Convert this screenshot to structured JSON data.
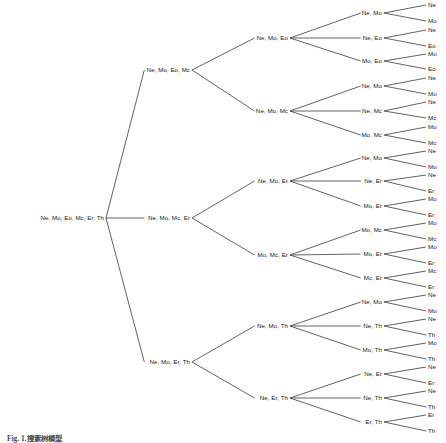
{
  "figure": {
    "type": "hierarchical-tree-diagram",
    "caption": "Fig. 1.搜索树模型",
    "orientation": "left-to-right",
    "levels": 5,
    "line_color": "#3a3a3a",
    "text_color": "#1a1a1a",
    "background": "#ffffff"
  },
  "tree": {
    "root": {
      "label": "Ne, Mo, Eo, Mc, Er, Th",
      "x": 104,
      "y": 218
    },
    "level2": [
      {
        "label": "Ne, Mo, Eo, Mc",
        "x": 190,
        "y": 70
      },
      {
        "label": "Ne, Mo, Mc, Er",
        "x": 190,
        "y": 218
      },
      {
        "label": "Ne, Mo, Er, Th",
        "x": 190,
        "y": 362
      }
    ],
    "level3": [
      {
        "label": "Ne, Mo, Eo",
        "x": 288,
        "y": 38
      },
      {
        "label": "Ne, Mo, Mc",
        "x": 288,
        "y": 111
      },
      {
        "label": "Ne, Mo, Er",
        "x": 288,
        "y": 181
      },
      {
        "label": "Mo, Mc, Er",
        "x": 288,
        "y": 255
      },
      {
        "label": "Ne, Mo, Th",
        "x": 288,
        "y": 326
      },
      {
        "label": "Ne, Er, Th",
        "x": 288,
        "y": 398
      }
    ],
    "level4": [
      {
        "label": "Ne, Mo",
        "x": 382,
        "y": 13
      },
      {
        "label": "Ne, Eo",
        "x": 382,
        "y": 38
      },
      {
        "label": "Mo, Eo",
        "x": 382,
        "y": 61
      },
      {
        "label": "Ne, Mo",
        "x": 382,
        "y": 86
      },
      {
        "label": "Ne, Mc",
        "x": 382,
        "y": 111
      },
      {
        "label": "Mo, Mc",
        "x": 382,
        "y": 135
      },
      {
        "label": "Ne, Mo",
        "x": 382,
        "y": 158
      },
      {
        "label": "Ne, Er",
        "x": 382,
        "y": 181
      },
      {
        "label": "Mo, Er",
        "x": 382,
        "y": 206
      },
      {
        "label": "Mo, Mc",
        "x": 382,
        "y": 230
      },
      {
        "label": "Mo, Er",
        "x": 382,
        "y": 254
      },
      {
        "label": "Mc, Er",
        "x": 382,
        "y": 278
      },
      {
        "label": "Ne, Mo",
        "x": 382,
        "y": 302
      },
      {
        "label": "Ne, Th",
        "x": 382,
        "y": 326
      },
      {
        "label": "Mo, Th",
        "x": 382,
        "y": 350
      },
      {
        "label": "Ne, Er",
        "x": 382,
        "y": 374
      },
      {
        "label": "Ne, Th",
        "x": 382,
        "y": 398
      },
      {
        "label": "Er, Th",
        "x": 382,
        "y": 422
      }
    ],
    "leaves": [
      {
        "label": "Ne",
        "x": 428,
        "y": 5
      },
      {
        "label": "Mo",
        "x": 428,
        "y": 21
      },
      {
        "label": "Ne",
        "x": 428,
        "y": 30
      },
      {
        "label": "Eo",
        "x": 428,
        "y": 46
      },
      {
        "label": "Mo",
        "x": 428,
        "y": 54
      },
      {
        "label": "Eo",
        "x": 428,
        "y": 69
      },
      {
        "label": "Ne",
        "x": 428,
        "y": 78
      },
      {
        "label": "Mo",
        "x": 428,
        "y": 94
      },
      {
        "label": "Ne",
        "x": 428,
        "y": 102
      },
      {
        "label": "Mc",
        "x": 428,
        "y": 118
      },
      {
        "label": "Mo",
        "x": 428,
        "y": 127
      },
      {
        "label": "Mc",
        "x": 428,
        "y": 143
      },
      {
        "label": "Ne",
        "x": 428,
        "y": 151
      },
      {
        "label": "Mo",
        "x": 428,
        "y": 167
      },
      {
        "label": "Ne",
        "x": 428,
        "y": 175
      },
      {
        "label": "Er",
        "x": 428,
        "y": 191
      },
      {
        "label": "Mo",
        "x": 428,
        "y": 199
      },
      {
        "label": "Er",
        "x": 428,
        "y": 215
      },
      {
        "label": "Mo",
        "x": 428,
        "y": 223
      },
      {
        "label": "Mc",
        "x": 428,
        "y": 239
      },
      {
        "label": "Mo",
        "x": 428,
        "y": 247
      },
      {
        "label": "Er",
        "x": 428,
        "y": 263
      },
      {
        "label": "Mc",
        "x": 428,
        "y": 271
      },
      {
        "label": "Er",
        "x": 428,
        "y": 287
      },
      {
        "label": "Ne",
        "x": 428,
        "y": 295
      },
      {
        "label": "Mo",
        "x": 428,
        "y": 311
      },
      {
        "label": "Ne",
        "x": 428,
        "y": 319
      },
      {
        "label": "Th",
        "x": 428,
        "y": 335
      },
      {
        "label": "Mo",
        "x": 428,
        "y": 343
      },
      {
        "label": "Th",
        "x": 428,
        "y": 359
      },
      {
        "label": "Ne",
        "x": 428,
        "y": 367
      },
      {
        "label": "Er",
        "x": 428,
        "y": 383
      },
      {
        "label": "Ne",
        "x": 428,
        "y": 391
      },
      {
        "label": "Th",
        "x": 428,
        "y": 407
      },
      {
        "label": "Er",
        "x": 428,
        "y": 415
      },
      {
        "label": "Th",
        "x": 428,
        "y": 431
      }
    ]
  }
}
